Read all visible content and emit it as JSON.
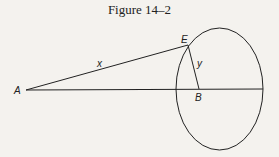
{
  "figure": {
    "title": "Figure 14–2",
    "labels": {
      "A": "A",
      "E": "E",
      "B": "B",
      "x": "x",
      "y": "y"
    },
    "colors": {
      "background": "#f4f2ee",
      "ink": "#222222"
    }
  }
}
